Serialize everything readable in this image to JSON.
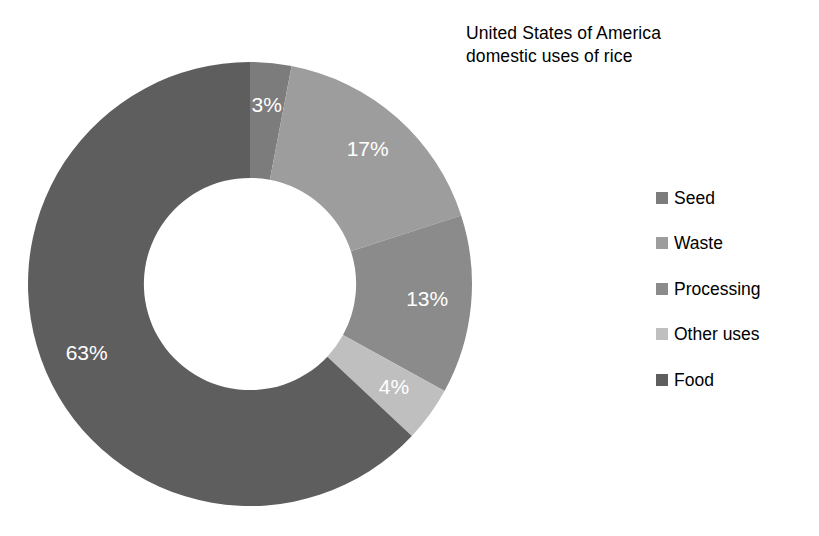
{
  "chart_data": {
    "type": "pie",
    "variant": "donut",
    "title": "United States of America\ndomestic uses of rice",
    "title_line1": "United States of America",
    "title_line2": "domestic uses of rice",
    "xlabel": "",
    "ylabel": "",
    "unit": "percent",
    "start_angle_deg": 0,
    "direction": "clockwise",
    "inner_radius_ratio": 0.478,
    "grid": false,
    "legend_position": "right",
    "categories": [
      "Seed",
      "Waste",
      "Processing",
      "Other uses",
      "Food"
    ],
    "values": [
      3,
      17,
      13,
      4,
      63
    ],
    "data_labels": [
      "3%",
      "17%",
      "13%",
      "4%",
      "63%"
    ],
    "data_label_color": "#ffffff",
    "colors": [
      "#7c7c7c",
      "#9d9d9d",
      "#8b8b8b",
      "#bfbfbf",
      "#5e5e5e"
    ],
    "slices": [
      {
        "name": "Seed",
        "value": 3,
        "label": "3%",
        "color": "#7c7c7c"
      },
      {
        "name": "Waste",
        "value": 17,
        "label": "17%",
        "color": "#9d9d9d"
      },
      {
        "name": "Processing",
        "value": 13,
        "label": "13%",
        "color": "#8b8b8b"
      },
      {
        "name": "Other uses",
        "value": 4,
        "label": "4%",
        "color": "#bfbfbf"
      },
      {
        "name": "Food",
        "value": 63,
        "label": "63%",
        "color": "#5e5e5e"
      }
    ]
  },
  "legend": {
    "items": [
      {
        "label": "Seed",
        "color": "#7c7c7c"
      },
      {
        "label": "Waste",
        "color": "#9d9d9d"
      },
      {
        "label": "Processing",
        "color": "#8b8b8b"
      },
      {
        "label": "Other uses",
        "color": "#bfbfbf"
      },
      {
        "label": "Food",
        "color": "#5e5e5e"
      }
    ]
  },
  "canvas": {
    "background": "#ffffff",
    "width": 819,
    "height": 536
  }
}
